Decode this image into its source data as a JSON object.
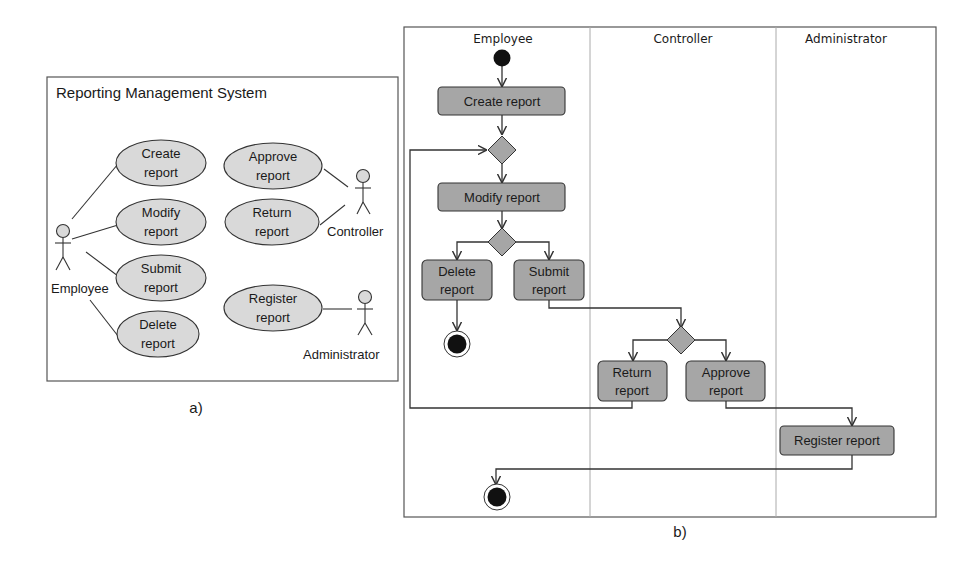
{
  "colors": {
    "background": "#ffffff",
    "stroke": "#333333",
    "usecase_fill": "#d9d9d9",
    "activity_fill": "#a6a6a6",
    "decision_fill": "#a6a6a6",
    "node_fill": "#111111"
  },
  "panel_a": {
    "caption": "a)",
    "system_title": "Reporting Management System",
    "actors": [
      {
        "name": "Employee"
      },
      {
        "name": "Controller"
      },
      {
        "name": "Administrator"
      }
    ],
    "use_cases": [
      {
        "line1": "Create",
        "line2": "report",
        "actor": "Employee"
      },
      {
        "line1": "Modify",
        "line2": "report",
        "actor": "Employee"
      },
      {
        "line1": "Submit",
        "line2": "report",
        "actor": "Employee"
      },
      {
        "line1": "Delete",
        "line2": "report",
        "actor": "Employee"
      },
      {
        "line1": "Approve",
        "line2": "report",
        "actor": "Controller"
      },
      {
        "line1": "Return",
        "line2": "report",
        "actor": "Controller"
      },
      {
        "line1": "Register",
        "line2": "report",
        "actor": "Administrator"
      }
    ]
  },
  "panel_b": {
    "caption": "b)",
    "lanes": [
      {
        "name": "Employee"
      },
      {
        "name": "Controller"
      },
      {
        "name": "Administrator"
      }
    ],
    "activities": {
      "create": {
        "label": "Create report"
      },
      "modify": {
        "label": "Modify report"
      },
      "delete": {
        "line1": "Delete",
        "line2": "report"
      },
      "submit": {
        "line1": "Submit",
        "line2": "report"
      },
      "return": {
        "line1": "Return",
        "line2": "report"
      },
      "approve": {
        "line1": "Approve",
        "line2": "report"
      },
      "register": {
        "label": "Register report"
      }
    }
  }
}
